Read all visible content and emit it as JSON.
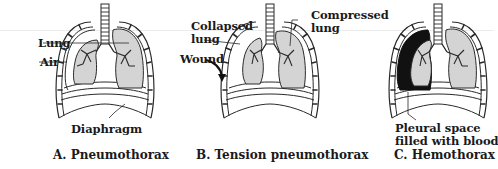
{
  "figure": {
    "panels": [
      {
        "id": "A",
        "caption": "A. Pneumothorax",
        "labels": {
          "lung": "Lung",
          "air": "Air",
          "diaphragm": "Diaphragm"
        }
      },
      {
        "id": "B",
        "caption": "B. Tension pneumothorax",
        "labels": {
          "collapsed_line1": "Collapsed",
          "collapsed_line2": "lung",
          "wound": "Wound",
          "compressed_line1": "Compressed",
          "compressed_line2": "lung"
        }
      },
      {
        "id": "C",
        "caption": "C. Hemothorax",
        "labels": {
          "pleural_line1": "Pleural space",
          "pleural_line2": "filled with blood"
        }
      }
    ],
    "colors": {
      "lung_fill": "#d4d4d4",
      "blood_fill": "#111111",
      "outline": "#2a2a2a",
      "background": "#ffffff"
    }
  }
}
